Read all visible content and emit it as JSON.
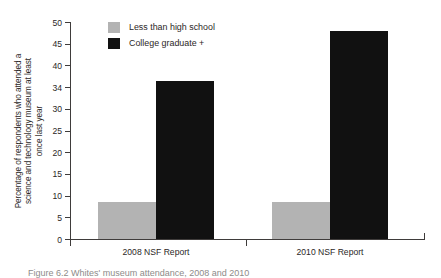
{
  "chart_data": {
    "type": "bar",
    "title": "",
    "subtitle": "",
    "xlabel": "",
    "ylabel": "Percentage of respondents who attended a science and technology museum at least once last year",
    "ylabel_lines": [
      "Percentage of respondents who attended a",
      "science and technology museum at least",
      "once last year"
    ],
    "categories": [
      "2008 NSF Report",
      "2010 NSF Report"
    ],
    "series": [
      {
        "name": "Less than high school",
        "color": "#b3b3b3",
        "values": [
          8.5,
          8.5
        ]
      },
      {
        "name": "College graduate +",
        "color": "#111111",
        "values": [
          36.5,
          48
        ]
      }
    ],
    "ylim": [
      0,
      50
    ],
    "yticks": [
      0,
      5,
      10,
      15,
      20,
      25,
      30,
      35,
      40,
      45,
      50
    ],
    "ytick_labels": [
      "0",
      "5",
      "10",
      "15",
      "20",
      "25",
      "30",
      "34",
      "40",
      "45",
      "50"
    ],
    "grid": false,
    "legend_position": "top-left-inside"
  },
  "legend": {
    "entries": [
      {
        "label": "Less than high school",
        "color": "#b3b3b3"
      },
      {
        "label": "College graduate +",
        "color": "#111111"
      }
    ]
  },
  "caption": {
    "text": "Figure 6.2 Whites' museum attendance, 2008 and 2010"
  }
}
